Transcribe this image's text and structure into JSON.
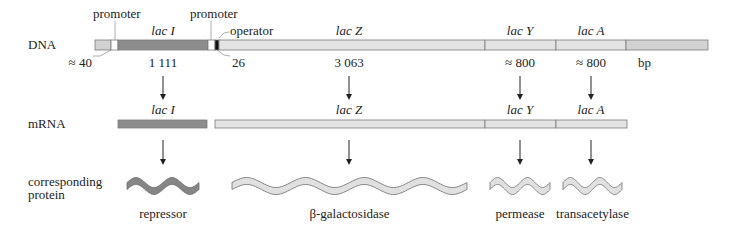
{
  "colors": {
    "lacI": "#8c8c8c",
    "gene_light": "#e3e3e3",
    "flank": "#d2d2d2",
    "promoter": "#ffffff",
    "operator": "#111111",
    "protein_light": "#e0e0e0",
    "protein_dark": "#858585",
    "outline": "#7a7a7a"
  },
  "row_labels": {
    "dna": "DNA",
    "mrna": "mRNA",
    "protein_line1": "corresponding",
    "protein_line2": "protein"
  },
  "dna": {
    "y": 40,
    "h": 10,
    "segments": [
      {
        "name": "upstream",
        "x1": 95,
        "x2": 111,
        "color": "flank"
      },
      {
        "name": "promoter-i",
        "x1": 111,
        "x2": 118,
        "color": "promoter"
      },
      {
        "name": "lacI",
        "x1": 118,
        "x2": 208,
        "color": "lacI"
      },
      {
        "name": "promoter-lac",
        "x1": 208,
        "x2": 215,
        "color": "promoter"
      },
      {
        "name": "operator",
        "x1": 215,
        "x2": 219,
        "color": "operator"
      },
      {
        "name": "lacZ",
        "x1": 219,
        "x2": 485,
        "color": "gene_light"
      },
      {
        "name": "lacY",
        "x1": 485,
        "x2": 556,
        "color": "gene_light"
      },
      {
        "name": "lacA",
        "x1": 556,
        "x2": 626,
        "color": "gene_light"
      },
      {
        "name": "downstream",
        "x1": 626,
        "x2": 708,
        "color": "flank"
      }
    ],
    "annotations": {
      "promoter1": "promoter",
      "promoter2": "promoter",
      "operator": "operator"
    },
    "gene_labels": [
      {
        "text": "lac I",
        "x": 163
      },
      {
        "text": "lac Z",
        "x": 349
      },
      {
        "text": "lac Y",
        "x": 520
      },
      {
        "text": "lac A",
        "x": 591
      }
    ],
    "lengths": [
      {
        "text": "≈ 40",
        "x": 92,
        "anchor": "end"
      },
      {
        "text": "1 111",
        "x": 163,
        "anchor": "middle"
      },
      {
        "text": "26",
        "x": 232,
        "anchor": "start"
      },
      {
        "text": "3 063",
        "x": 349,
        "anchor": "middle"
      },
      {
        "text": "≈ 800",
        "x": 520,
        "anchor": "middle"
      },
      {
        "text": "≈ 800",
        "x": 591,
        "anchor": "middle"
      },
      {
        "text": "bp",
        "x": 638,
        "anchor": "start"
      }
    ]
  },
  "mrna": {
    "y": 120,
    "h": 8,
    "segments": [
      {
        "name": "lacI",
        "x1": 118,
        "x2": 207,
        "color": "lacI"
      },
      {
        "name": "lacZ",
        "x1": 215,
        "x2": 485,
        "color": "gene_light"
      },
      {
        "name": "lacY",
        "x1": 485,
        "x2": 556,
        "color": "gene_light"
      },
      {
        "name": "lacA",
        "x1": 556,
        "x2": 627,
        "color": "gene_light"
      }
    ],
    "gene_labels": [
      {
        "text": "lac I",
        "x": 163
      },
      {
        "text": "lac Z",
        "x": 349
      },
      {
        "text": "lac Y",
        "x": 520
      },
      {
        "text": "lac A",
        "x": 591
      }
    ]
  },
  "arrows_dna_to_mrna": [
    163,
    349,
    520,
    591
  ],
  "arrows_mrna_to_protein": [
    163,
    349,
    520,
    591
  ],
  "proteins": [
    {
      "name": "repressor",
      "label": "repressor",
      "x1": 127,
      "x2": 199,
      "periods": 2,
      "color": "protein_dark"
    },
    {
      "name": "beta-galactosidase",
      "label": "β-galactosidase",
      "x1": 232,
      "x2": 467,
      "periods": 4,
      "color": "protein_light"
    },
    {
      "name": "permease",
      "label": "permease",
      "x1": 490,
      "x2": 550,
      "periods": 2,
      "color": "protein_light"
    },
    {
      "name": "transacetylase",
      "label": "transacetylase",
      "x1": 563,
      "x2": 622,
      "periods": 2,
      "color": "protein_light"
    }
  ]
}
